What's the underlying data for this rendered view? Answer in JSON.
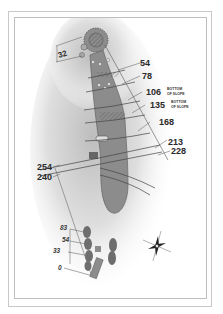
{
  "hole_diagram": {
    "green_width_label": "32",
    "yardage_markers": [
      {
        "value": "54",
        "note": ""
      },
      {
        "value": "78",
        "note": ""
      },
      {
        "value": "106",
        "note_line1": "BOTTOM",
        "note_line2": "OF SLOPE"
      },
      {
        "value": "135",
        "note_line1": "BOTTOM",
        "note_line2": "OF SLOPE"
      },
      {
        "value": "168",
        "note": ""
      },
      {
        "value": "213",
        "note": ""
      },
      {
        "value": "228",
        "note": ""
      },
      {
        "value": "254",
        "note": ""
      },
      {
        "value": "240",
        "note": ""
      }
    ],
    "tee_markers": [
      {
        "value": "83"
      },
      {
        "value": "54"
      },
      {
        "value": "33"
      },
      {
        "value": "0"
      }
    ],
    "compass": {
      "icon": "compass-rose-icon"
    },
    "colors": {
      "fairway": "#8c8c8c",
      "rough_shadow": "#c8c8c8",
      "text": "#2a2a2a",
      "line": "#555555",
      "frame": "#c8c8c8"
    }
  }
}
